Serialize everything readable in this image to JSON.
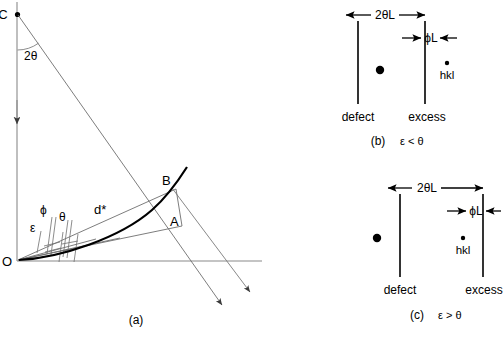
{
  "figure": {
    "panels": [
      {
        "id": "a",
        "caption": "(a)",
        "labels": {
          "point_c": "C",
          "point_o": "O",
          "point_a": "A",
          "point_b": "B",
          "angle_two_theta": "2θ",
          "angle_phi": "ϕ",
          "angle_theta": "θ",
          "angle_epsilon": "ε",
          "vector_dstar": "d*"
        }
      },
      {
        "id": "b",
        "caption_index": "(b)",
        "caption_condition": "ε < θ",
        "labels": {
          "dim_two_theta_l": "2θL",
          "dim_phi_l": "ϕL",
          "line_left": "defect",
          "line_right": "excess",
          "spot_label": "hkl"
        }
      },
      {
        "id": "c",
        "caption_index": "(c)",
        "caption_condition": "ε > θ",
        "labels": {
          "dim_two_theta_l": "2θL",
          "dim_phi_l": "ϕL",
          "line_left": "defect",
          "line_right": "excess",
          "spot_label": "hkl"
        }
      }
    ],
    "colors": {
      "ink": "#000000",
      "thin_line": "#6e6e6e",
      "axis": "#8a8a8a",
      "background": "#ffffff"
    }
  }
}
